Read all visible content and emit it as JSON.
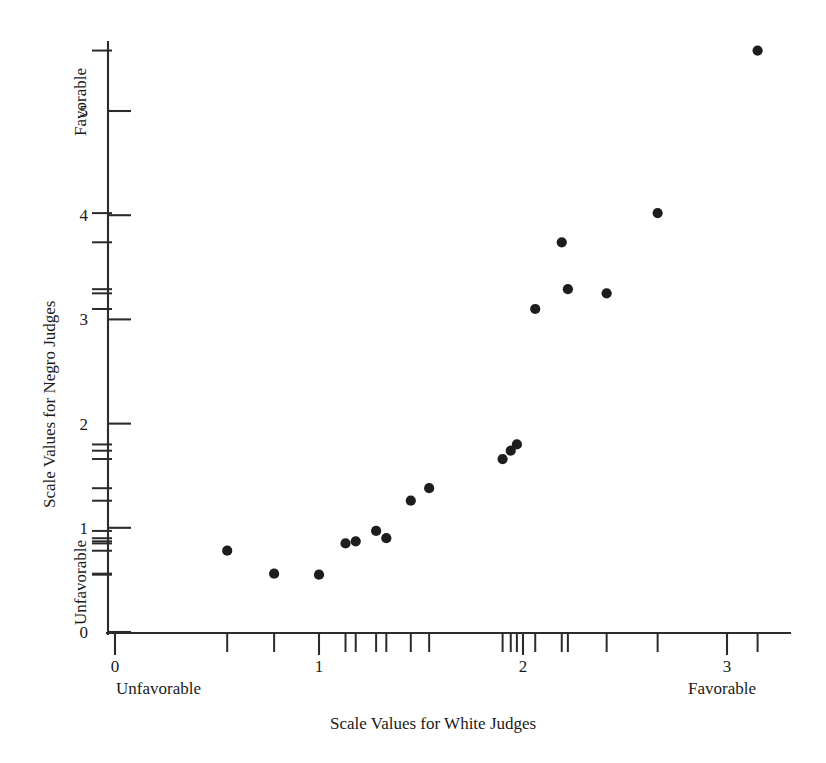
{
  "chart_data": {
    "type": "scatter",
    "title": "",
    "xlabel": "Scale Values for White Judges",
    "ylabel": "Scale Values for Negro Judges",
    "xlim": [
      0,
      3.2
    ],
    "ylim": [
      0,
      5.6
    ],
    "grid": false,
    "legend": null,
    "x_ticks": [
      0,
      1,
      2,
      3
    ],
    "x_tick_labels": [
      "0",
      "1",
      "2",
      "3"
    ],
    "y_ticks": [
      0,
      1,
      2,
      3,
      4,
      5
    ],
    "y_tick_labels": [
      "0",
      "1",
      "2",
      "3",
      "4",
      "5"
    ],
    "x_axis_end_labels": {
      "low": "Unfavorable",
      "high": "Favorable"
    },
    "y_axis_end_labels": {
      "low": "Unfavorable",
      "high": "Favorable"
    },
    "points": [
      {
        "x": 0.55,
        "y": 0.78
      },
      {
        "x": 0.78,
        "y": 0.56
      },
      {
        "x": 1.0,
        "y": 0.55
      },
      {
        "x": 1.13,
        "y": 0.85
      },
      {
        "x": 1.18,
        "y": 0.87
      },
      {
        "x": 1.28,
        "y": 0.97
      },
      {
        "x": 1.33,
        "y": 0.9
      },
      {
        "x": 1.45,
        "y": 1.26
      },
      {
        "x": 1.54,
        "y": 1.38
      },
      {
        "x": 1.9,
        "y": 1.66
      },
      {
        "x": 1.94,
        "y": 1.74
      },
      {
        "x": 1.97,
        "y": 1.8
      },
      {
        "x": 2.06,
        "y": 3.1
      },
      {
        "x": 2.19,
        "y": 3.74
      },
      {
        "x": 2.22,
        "y": 3.29
      },
      {
        "x": 2.41,
        "y": 3.25
      },
      {
        "x": 2.66,
        "y": 4.02
      },
      {
        "x": 3.15,
        "y": 5.58
      }
    ],
    "x_rug_ticks": [
      0.55,
      0.78,
      1.0,
      1.13,
      1.18,
      1.28,
      1.33,
      1.45,
      1.54,
      1.9,
      1.94,
      1.97,
      2.06,
      2.19,
      2.22,
      2.41,
      2.66,
      3.15
    ],
    "y_rug_ticks": [
      0.55,
      0.56,
      0.78,
      0.85,
      0.87,
      0.9,
      0.97,
      1.26,
      1.38,
      1.66,
      1.74,
      1.8,
      3.1,
      3.25,
      3.29,
      3.74,
      4.02,
      5.58
    ]
  },
  "colors": {
    "point": "#1d1d1d",
    "axis": "#2b2b2b",
    "background": "#ffffff",
    "text": "#1a1a1a"
  }
}
